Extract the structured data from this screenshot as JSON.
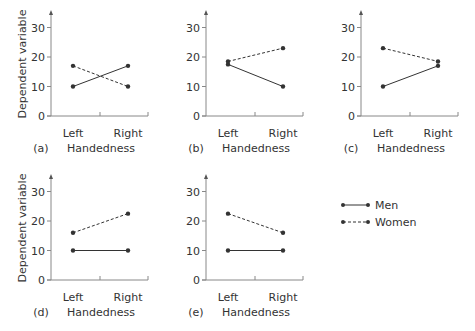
{
  "figure": {
    "y_axis_label": "Dependent variable",
    "x_axis_label": "Handedness",
    "y_ticks": [
      "0",
      "10",
      "20",
      "30"
    ],
    "categories": [
      "Left",
      "Right"
    ],
    "legend": [
      {
        "label": "Men",
        "style": "solid"
      },
      {
        "label": "Women",
        "style": "dashed"
      }
    ],
    "line_color": "#333333"
  },
  "chart_data": [
    {
      "type": "line",
      "panel": "(a)",
      "xlabel": "Handedness",
      "ylabel": "Dependent variable",
      "ylim": [
        0,
        30
      ],
      "categories": [
        "Left",
        "Right"
      ],
      "series": [
        {
          "name": "Men",
          "values": [
            10,
            17
          ]
        },
        {
          "name": "Women",
          "values": [
            17,
            10
          ]
        }
      ]
    },
    {
      "type": "line",
      "panel": "(b)",
      "xlabel": "Handedness",
      "ylabel": "",
      "ylim": [
        0,
        30
      ],
      "categories": [
        "Left",
        "Right"
      ],
      "series": [
        {
          "name": "Men",
          "values": [
            17.5,
            10
          ]
        },
        {
          "name": "Women",
          "values": [
            18.5,
            23
          ]
        }
      ]
    },
    {
      "type": "line",
      "panel": "(c)",
      "xlabel": "Handedness",
      "ylabel": "",
      "ylim": [
        0,
        30
      ],
      "categories": [
        "Left",
        "Right"
      ],
      "series": [
        {
          "name": "Men",
          "values": [
            10,
            17
          ]
        },
        {
          "name": "Women",
          "values": [
            23,
            18.5
          ]
        }
      ]
    },
    {
      "type": "line",
      "panel": "(d)",
      "xlabel": "Handedness",
      "ylabel": "Dependent variable",
      "ylim": [
        0,
        30
      ],
      "categories": [
        "Left",
        "Right"
      ],
      "series": [
        {
          "name": "Men",
          "values": [
            10,
            10
          ]
        },
        {
          "name": "Women",
          "values": [
            16,
            22.5
          ]
        }
      ]
    },
    {
      "type": "line",
      "panel": "(e)",
      "xlabel": "Handedness",
      "ylabel": "",
      "ylim": [
        0,
        30
      ],
      "categories": [
        "Left",
        "Right"
      ],
      "series": [
        {
          "name": "Men",
          "values": [
            10,
            10
          ]
        },
        {
          "name": "Women",
          "values": [
            22.5,
            16
          ]
        }
      ]
    }
  ]
}
